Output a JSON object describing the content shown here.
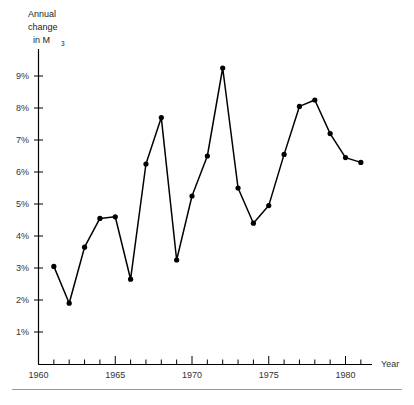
{
  "chart_data": {
    "type": "line",
    "title": "",
    "ylabel_lines": [
      "Annual",
      "change",
      "in  M"
    ],
    "ylabel_subscript": "3",
    "xlabel": "Year",
    "x": [
      1961,
      1962,
      1963,
      1964,
      1965,
      1966,
      1967,
      1968,
      1969,
      1970,
      1971,
      1972,
      1973,
      1974,
      1975,
      1976,
      1977,
      1978,
      1979,
      1980,
      1981
    ],
    "values": [
      3.05,
      1.9,
      3.65,
      4.55,
      4.6,
      2.65,
      6.25,
      7.7,
      3.25,
      5.25,
      6.5,
      9.25,
      5.5,
      4.4,
      4.95,
      6.55,
      8.05,
      8.25,
      7.2,
      6.45,
      6.3
    ],
    "y_tick_labels": [
      "1%",
      "2%",
      "3%",
      "4%",
      "5%",
      "6%",
      "7%",
      "8%",
      "9%"
    ],
    "y_tick_values": [
      1,
      2,
      3,
      4,
      5,
      6,
      7,
      8,
      9
    ],
    "x_tick_labels": [
      "1960",
      "1965",
      "1970",
      "1975",
      "1980"
    ],
    "x_tick_values": [
      1960,
      1965,
      1970,
      1975,
      1980
    ],
    "x_minor_ticks": [
      1961,
      1962,
      1963,
      1964,
      1966,
      1967,
      1968,
      1969,
      1971,
      1972,
      1973,
      1974,
      1976,
      1977,
      1978,
      1979,
      1981
    ],
    "xlim": [
      1960,
      1981.6
    ],
    "ylim": [
      0,
      9.9
    ],
    "grid": false,
    "legend": "none",
    "line_color": "#000000",
    "marker_color": "#000000",
    "axis_color": "#000000"
  },
  "footer": {
    "rule_present": true,
    "ghost_text": ""
  }
}
